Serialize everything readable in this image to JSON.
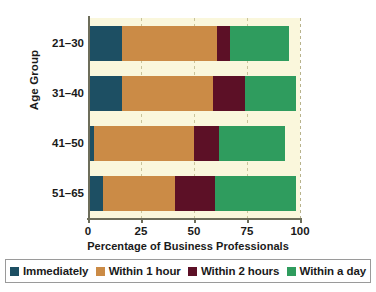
{
  "chart_data": {
    "type": "bar",
    "orientation": "horizontal",
    "stacked": true,
    "title": "",
    "xlabel": "Percentage of Business Professionals",
    "ylabel": "Age Group",
    "categories": [
      "21–30",
      "31–40",
      "41–50",
      "51–65"
    ],
    "xlim": [
      0,
      100
    ],
    "xticks": [
      0,
      25,
      50,
      75,
      100
    ],
    "xtick_labels": [
      "0",
      "25",
      "50",
      "75",
      "100"
    ],
    "grid": true,
    "grid_axis": "x",
    "legend_position": "bottom",
    "series": [
      {
        "name": "Immediately",
        "color": "#1d4f63",
        "values": [
          16,
          16,
          3,
          7
        ]
      },
      {
        "name": "Within 1 hour",
        "color": "#cb8b46",
        "values": [
          45,
          43,
          47,
          34
        ]
      },
      {
        "name": "Within 2 hours",
        "color": "#5c1026",
        "values": [
          6,
          15,
          12,
          19
        ]
      },
      {
        "name": "Within a day",
        "color": "#2f9c5e",
        "values": [
          28,
          24,
          31,
          38
        ]
      }
    ],
    "totals": [
      95,
      98,
      93,
      98
    ],
    "colors": {
      "plot_background": "#faf7dc",
      "figure_background": "#ffffff",
      "axis": "#6d6d5a",
      "gridline": "#c9c49a",
      "text": "#1a1a1a",
      "legend_border": "#9a9a9a"
    }
  }
}
